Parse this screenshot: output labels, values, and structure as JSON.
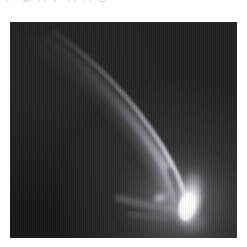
{
  "page": {
    "background_color": "#ffffff",
    "width": 247,
    "height": 247
  },
  "caption": {
    "text": "P C A F  A A B",
    "color": "#d8d8dc",
    "clipped_by_top_edge": true
  },
  "image_panel": {
    "name": "astronomical-image",
    "subject": "comet",
    "background_color": "#221f1f",
    "x": 10,
    "y": 22,
    "width": 227,
    "height": 216,
    "features": {
      "nucleus": {
        "label": "bright-nucleus",
        "color": "#ffffff",
        "center_x": 182,
        "center_y": 201,
        "shape": "teardrop"
      },
      "coma": {
        "label": "inner-coma",
        "color": "#e8e8ee"
      },
      "tail_arcs": {
        "label": "curved-dust-tail",
        "count": 3,
        "color": "#b9b9c4",
        "direction": "upper-left"
      }
    }
  }
}
